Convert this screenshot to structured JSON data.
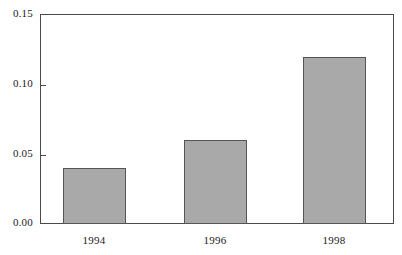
{
  "chart_data": {
    "type": "bar",
    "title": "",
    "subtitle": "",
    "xlabel": "",
    "ylabel": "",
    "categories": [
      "1994",
      "1996",
      "1998"
    ],
    "values": [
      0.04,
      0.06,
      0.12
    ],
    "series": [
      {
        "name": "",
        "values": [
          0.04,
          0.06,
          0.12
        ]
      }
    ],
    "ylim": [
      0.0,
      0.15
    ],
    "ytick_labels": [
      "0.00",
      "0.05",
      "0.10",
      "0.15"
    ],
    "ytick_values": [
      0.0,
      0.05,
      0.1,
      0.15
    ],
    "grid": false,
    "legend": null,
    "annotations": [],
    "colors": {
      "bar_fill": "#a9a9a9",
      "bar_edge": "#555555",
      "axis": "#4a4a4a",
      "text": "#1a1a1a",
      "background": "#ffffff"
    }
  }
}
